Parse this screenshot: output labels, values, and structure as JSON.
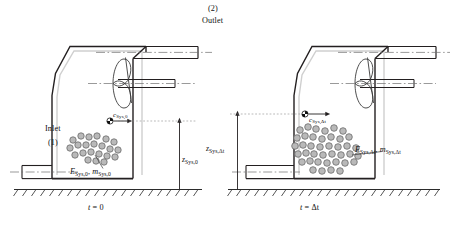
{
  "figure": {
    "type": "thermodynamic-open-system-control-volume-diagram",
    "panels": [
      {
        "id": "left",
        "time_label_prefix": "t",
        "time_label_eq": "=",
        "time_label_value": "0",
        "state_subscript": "Sys,0",
        "energy_mass_label_E": "E",
        "energy_mass_label_E_sub": "Sys,0",
        "energy_mass_sep": ", ",
        "energy_mass_label_m": "m",
        "energy_mass_label_m_sub": "Sys,0",
        "velocity_label": "c",
        "velocity_sub": "Sys,0",
        "height_label": "z",
        "height_sub": "Sys,0",
        "port_number": "(1)",
        "port_name": "Inlet",
        "particle_count": 22
      },
      {
        "id": "right",
        "time_label_prefix": "t",
        "time_label_eq": "=",
        "time_label_value": "Δt",
        "state_subscript": "Sys,Δt",
        "energy_mass_label_E": "E",
        "energy_mass_label_E_sub": "Sys,Δt",
        "energy_mass_sep": ", ",
        "energy_mass_label_m": "m",
        "energy_mass_label_m_sub": "Sys,Δt",
        "velocity_label": "c",
        "velocity_sub": "Sys,Δt",
        "height_label": "z",
        "height_sub": "Sys,Δt",
        "particle_count": 40
      }
    ],
    "outlet_number": "(2)",
    "outlet_name": "Outlet",
    "colors": {
      "line": "#231f20",
      "thin_line": "#555555",
      "centerline": "#6e6e6e",
      "particle_fill": "#b9b9b9",
      "particle_stroke": "#6b6b6b",
      "vessel_inner": "#d9d9d9",
      "ground": "#2b2b2b",
      "background": "#ffffff"
    }
  }
}
